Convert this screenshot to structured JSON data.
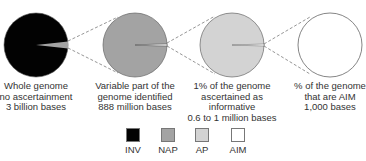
{
  "colors": {
    "INV": "#020202",
    "NAP": "#a3a3a3",
    "AP": "#d3d3d3",
    "AIM": "#ffffff",
    "outline": "#777777",
    "connector": "#8a8a8a"
  },
  "circles": [
    {
      "name": "whole-genome",
      "fill_key": "INV",
      "slice_key": "NAP",
      "caption": [
        "Whole genome",
        "no ascertainment",
        "3 billion bases"
      ]
    },
    {
      "name": "variable-part",
      "fill_key": "NAP",
      "slice_key": "AP",
      "caption": [
        "Variable part of the",
        "genome identified",
        "888 million bases"
      ]
    },
    {
      "name": "ascertained-informative",
      "fill_key": "AP",
      "slice_key": "AIM",
      "caption": [
        "1% of the genome",
        "ascertained as",
        "informative",
        "0.6 to 1 million bases"
      ]
    },
    {
      "name": "aim",
      "fill_key": "AIM",
      "slice_key": null,
      "caption": [
        "% of the genome",
        "that are AIM",
        "1,000 bases"
      ]
    }
  ],
  "legend": [
    {
      "key": "INV",
      "label": "INV",
      "color": "#020202"
    },
    {
      "key": "NAP",
      "label": "NAP",
      "color": "#a3a3a3"
    },
    {
      "key": "AP",
      "label": "AP",
      "color": "#d3d3d3"
    },
    {
      "key": "AIM",
      "label": "AIM",
      "color": "#ffffff"
    }
  ]
}
